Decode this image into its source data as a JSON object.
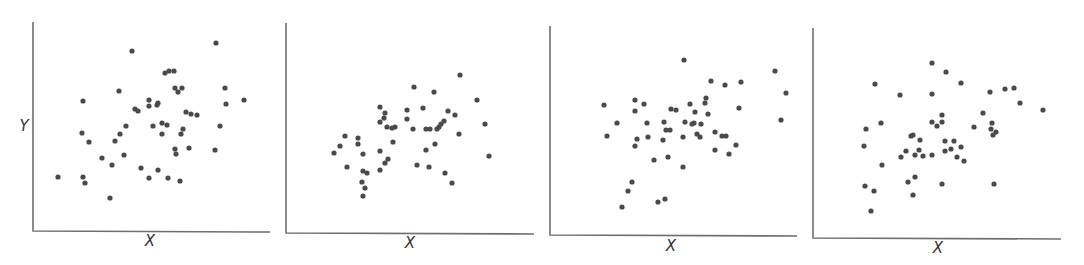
{
  "chart_data": [
    {
      "type": "scatter",
      "title": "",
      "xlabel": "X",
      "ylabel": "Y",
      "grid": false,
      "ticks": false,
      "axes_px": {
        "x0": 33,
        "y_top": 22,
        "y_bottom": 231,
        "x_end": 270
      },
      "xlabel_px": [
        150,
        246
      ],
      "ylabel_px": [
        24,
        131
      ],
      "points_px": [
        [
          216,
          43
        ],
        [
          132,
          51
        ],
        [
          165,
          73
        ],
        [
          169,
          71
        ],
        [
          174,
          71
        ],
        [
          119,
          91
        ],
        [
          175,
          88
        ],
        [
          178,
          92
        ],
        [
          182,
          88
        ],
        [
          225,
          88
        ],
        [
          83,
          101
        ],
        [
          149,
          100
        ],
        [
          149,
          106
        ],
        [
          157,
          105
        ],
        [
          158,
          103
        ],
        [
          135,
          109
        ],
        [
          138,
          111
        ],
        [
          244,
          100
        ],
        [
          226,
          104
        ],
        [
          186,
          112
        ],
        [
          191,
          114
        ],
        [
          197,
          115
        ],
        [
          126,
          126
        ],
        [
          153,
          126
        ],
        [
          162,
          123
        ],
        [
          167,
          125
        ],
        [
          183,
          129
        ],
        [
          220,
          126
        ],
        [
          82,
          133
        ],
        [
          120,
          134
        ],
        [
          162,
          134
        ],
        [
          181,
          134
        ],
        [
          89,
          142
        ],
        [
          115,
          141
        ],
        [
          175,
          149
        ],
        [
          176,
          154
        ],
        [
          189,
          148
        ],
        [
          215,
          150
        ],
        [
          102,
          158
        ],
        [
          124,
          155
        ],
        [
          112,
          165
        ],
        [
          141,
          168
        ],
        [
          158,
          170
        ],
        [
          58,
          177
        ],
        [
          83,
          177
        ],
        [
          85,
          183
        ],
        [
          149,
          178
        ],
        [
          168,
          178
        ],
        [
          180,
          181
        ],
        [
          110,
          198
        ]
      ]
    },
    {
      "type": "scatter",
      "title": "",
      "xlabel": "X",
      "ylabel": "",
      "grid": false,
      "ticks": false,
      "axes_px": {
        "x0": 286,
        "y_top": 23,
        "y_bottom": 233,
        "x_end": 534
      },
      "xlabel_px": [
        410,
        248
      ],
      "points_px": [
        [
          460,
          75
        ],
        [
          414,
          87
        ],
        [
          434,
          92
        ],
        [
          380,
          107
        ],
        [
          407,
          110
        ],
        [
          423,
          108
        ],
        [
          477,
          100
        ],
        [
          448,
          111
        ],
        [
          455,
          115
        ],
        [
          385,
          113
        ],
        [
          384,
          118
        ],
        [
          380,
          122
        ],
        [
          407,
          119
        ],
        [
          387,
          127
        ],
        [
          392,
          128
        ],
        [
          395,
          127
        ],
        [
          413,
          129
        ],
        [
          426,
          129
        ],
        [
          430,
          129
        ],
        [
          437,
          129
        ],
        [
          439,
          127
        ],
        [
          441,
          124
        ],
        [
          444,
          121
        ],
        [
          485,
          124
        ],
        [
          459,
          134
        ],
        [
          393,
          142
        ],
        [
          435,
          144
        ],
        [
          345,
          136
        ],
        [
          358,
          138
        ],
        [
          358,
          144
        ],
        [
          340,
          146
        ],
        [
          334,
          153
        ],
        [
          363,
          154
        ],
        [
          380,
          151
        ],
        [
          426,
          150
        ],
        [
          489,
          156
        ],
        [
          388,
          159
        ],
        [
          385,
          163
        ],
        [
          347,
          167
        ],
        [
          380,
          170
        ],
        [
          417,
          165
        ],
        [
          429,
          167
        ],
        [
          445,
          173
        ],
        [
          363,
          171
        ],
        [
          367,
          173
        ],
        [
          452,
          183
        ],
        [
          362,
          182
        ],
        [
          365,
          188
        ],
        [
          363,
          196
        ]
      ]
    },
    {
      "type": "scatter",
      "title": "",
      "xlabel": "X",
      "ylabel": "",
      "grid": false,
      "ticks": false,
      "axes_px": {
        "x0": 550,
        "y_top": 26,
        "y_bottom": 235,
        "x_end": 797
      },
      "xlabel_px": [
        671,
        251
      ],
      "points_px": [
        [
          684,
          60
        ],
        [
          775,
          71
        ],
        [
          711,
          81
        ],
        [
          725,
          85
        ],
        [
          741,
          82
        ],
        [
          786,
          93
        ],
        [
          604,
          105
        ],
        [
          635,
          100
        ],
        [
          644,
          104
        ],
        [
          635,
          111
        ],
        [
          671,
          109
        ],
        [
          676,
          110
        ],
        [
          690,
          104
        ],
        [
          706,
          98
        ],
        [
          705,
          103
        ],
        [
          695,
          112
        ],
        [
          708,
          114
        ],
        [
          739,
          108
        ],
        [
          781,
          120
        ],
        [
          617,
          123
        ],
        [
          647,
          123
        ],
        [
          664,
          122
        ],
        [
          685,
          122
        ],
        [
          692,
          124
        ],
        [
          694,
          123
        ],
        [
          701,
          124
        ],
        [
          666,
          130
        ],
        [
          670,
          130
        ],
        [
          607,
          136
        ],
        [
          637,
          139
        ],
        [
          648,
          137
        ],
        [
          663,
          140
        ],
        [
          683,
          137
        ],
        [
          697,
          134
        ],
        [
          700,
          137
        ],
        [
          715,
          132
        ],
        [
          722,
          136
        ],
        [
          726,
          136
        ],
        [
          635,
          146
        ],
        [
          715,
          150
        ],
        [
          736,
          145
        ],
        [
          729,
          154
        ],
        [
          654,
          160
        ],
        [
          668,
          157
        ],
        [
          683,
          167
        ],
        [
          632,
          182
        ],
        [
          628,
          191
        ],
        [
          622,
          207
        ],
        [
          658,
          202
        ],
        [
          665,
          199
        ]
      ]
    },
    {
      "type": "scatter",
      "title": "",
      "xlabel": "X",
      "ylabel": "",
      "grid": false,
      "ticks": false,
      "axes_px": {
        "x0": 813,
        "y_top": 28,
        "y_bottom": 238,
        "x_end": 1061
      },
      "xlabel_px": [
        938,
        253
      ],
      "points_px": [
        [
          932,
          63
        ],
        [
          946,
          72
        ],
        [
          961,
          83
        ],
        [
          875,
          84
        ],
        [
          900,
          95
        ],
        [
          932,
          94
        ],
        [
          990,
          92
        ],
        [
          1005,
          89
        ],
        [
          1014,
          88
        ],
        [
          1020,
          103
        ],
        [
          1043,
          110
        ],
        [
          983,
          113
        ],
        [
          942,
          115
        ],
        [
          932,
          122
        ],
        [
          942,
          122
        ],
        [
          937,
          126
        ],
        [
          881,
          123
        ],
        [
          866,
          129
        ],
        [
          974,
          127
        ],
        [
          992,
          123
        ],
        [
          991,
          129
        ],
        [
          996,
          132
        ],
        [
          993,
          135
        ],
        [
          911,
          136
        ],
        [
          913,
          135
        ],
        [
          920,
          140
        ],
        [
          945,
          141
        ],
        [
          954,
          141
        ],
        [
          864,
          146
        ],
        [
          961,
          147
        ],
        [
          951,
          149
        ],
        [
          945,
          151
        ],
        [
          919,
          150
        ],
        [
          906,
          151
        ],
        [
          901,
          157
        ],
        [
          915,
          155
        ],
        [
          923,
          156
        ],
        [
          932,
          155
        ],
        [
          957,
          157
        ],
        [
          964,
          161
        ],
        [
          882,
          165
        ],
        [
          915,
          177
        ],
        [
          908,
          182
        ],
        [
          942,
          184
        ],
        [
          994,
          184
        ],
        [
          865,
          186
        ],
        [
          874,
          191
        ],
        [
          913,
          195
        ],
        [
          871,
          211
        ]
      ]
    }
  ],
  "labels": {
    "y": "Y",
    "x1": "X",
    "x2": "X",
    "x3": "X",
    "x4": "X"
  },
  "colors": {
    "dot": "#4a4a4a",
    "axis": "#6e6e6e",
    "background": "#ffffff"
  }
}
